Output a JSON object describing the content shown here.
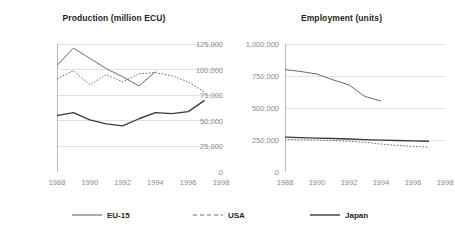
{
  "chart_data": [
    {
      "type": "line",
      "title": "Production (million ECU)",
      "xlabel": "",
      "ylabel": "",
      "xlim": [
        1988,
        1998
      ],
      "ylim": [
        0,
        125000
      ],
      "grid": true,
      "legend_position": "bottom",
      "x": [
        1988,
        1989,
        1990,
        1991,
        1992,
        1993,
        1994,
        1995,
        1996,
        1997
      ],
      "xticks": [
        1988,
        1990,
        1992,
        1994,
        1996,
        1998
      ],
      "xticklabels": [
        "1988",
        "1990",
        "1992",
        "1994",
        "1996",
        "1998"
      ],
      "yticks": [
        0,
        25000,
        50000,
        75000,
        100000,
        125000
      ],
      "yticklabels": [
        "0",
        "25,000",
        "50,000",
        "75,000",
        "100,000",
        "125,000"
      ],
      "series": [
        {
          "name": "EU-15",
          "style": "solid-thin",
          "color": "#58595b",
          "values": [
            104000,
            121000,
            111000,
            101000,
            93000,
            84000,
            98000,
            null,
            null,
            null
          ]
        },
        {
          "name": "USA",
          "style": "dashed",
          "color": "#6d6e70",
          "values": [
            91000,
            99000,
            85000,
            95000,
            88000,
            96000,
            97000,
            94000,
            88000,
            78000
          ]
        },
        {
          "name": "Japan",
          "style": "solid-thick",
          "color": "#3b3b3d",
          "values": [
            55000,
            58000,
            51000,
            47000,
            45000,
            52000,
            58000,
            57000,
            59000,
            70000
          ]
        }
      ]
    },
    {
      "type": "line",
      "title": "Employment (units)",
      "xlabel": "",
      "ylabel": "",
      "xlim": [
        1988,
        1998
      ],
      "ylim": [
        0,
        1000000
      ],
      "grid": true,
      "legend_position": "bottom",
      "x": [
        1988,
        1989,
        1990,
        1991,
        1992,
        1993,
        1994,
        1995,
        1996,
        1997
      ],
      "xticks": [
        1988,
        1990,
        1992,
        1994,
        1996,
        1998
      ],
      "xticklabels": [
        "1988",
        "1990",
        "1992",
        "1994",
        "1996",
        "1998"
      ],
      "yticks": [
        0,
        250000,
        500000,
        750000,
        1000000
      ],
      "yticklabels": [
        "0",
        "250,000",
        "500,000",
        "750,000",
        "1,000,000"
      ],
      "series": [
        {
          "name": "EU-15",
          "style": "solid-thin",
          "color": "#58595b",
          "values": [
            800000,
            785000,
            765000,
            720000,
            680000,
            590000,
            555000,
            null,
            null,
            null
          ]
        },
        {
          "name": "USA",
          "style": "dashed",
          "color": "#6d6e70",
          "values": [
            255000,
            252000,
            250000,
            246000,
            240000,
            232000,
            218000,
            208000,
            200000,
            195000
          ]
        },
        {
          "name": "Japan",
          "style": "solid-thick",
          "color": "#3b3b3d",
          "values": [
            272000,
            268000,
            265000,
            262000,
            258000,
            253000,
            249000,
            246000,
            243000,
            240000
          ]
        }
      ]
    }
  ],
  "legend": {
    "items": [
      {
        "label": "EU-15",
        "style": "solid-thin"
      },
      {
        "label": "USA",
        "style": "dashed"
      },
      {
        "label": "Japan",
        "style": "solid-thick"
      }
    ]
  },
  "colors": {
    "background": "#ffffff",
    "grid": "#d6d6d6",
    "axis": "#a8a8a8",
    "tick_text": "#8b8b8b",
    "title_text": "#231f20"
  }
}
